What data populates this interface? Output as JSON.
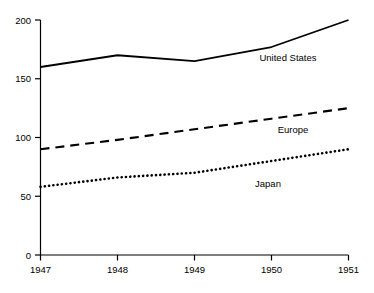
{
  "chart_data": {
    "type": "line",
    "title": "",
    "subtitle": "",
    "xlabel": "",
    "ylabel": "",
    "x": [
      1947,
      1948,
      1949,
      1950,
      1951
    ],
    "categories": [
      "1947",
      "1948",
      "1949",
      "1950",
      "1951"
    ],
    "xlim": [
      1947,
      1951
    ],
    "ylim": [
      0,
      200
    ],
    "yticks": [
      0,
      50,
      100,
      150,
      200
    ],
    "ytick_labels": [
      "0",
      "50",
      "100",
      "150",
      "200"
    ],
    "xticks": [
      1947,
      1948,
      1949,
      1950,
      1951
    ],
    "xtick_labels": [
      "1947",
      "1948",
      "1949",
      "1950",
      "1951"
    ],
    "grid": false,
    "legend_position": "inline-annotations",
    "series": [
      {
        "name": "United States",
        "style": "solid",
        "color": "#000000",
        "values": [
          160,
          170,
          165,
          177,
          200
        ],
        "label": "United States"
      },
      {
        "name": "Europe",
        "style": "dashed",
        "color": "#000000",
        "values": [
          90,
          98,
          107,
          116,
          125
        ],
        "label": "Europe"
      },
      {
        "name": "Japan",
        "style": "dotted",
        "color": "#000000",
        "values": [
          58,
          66,
          70,
          80,
          90
        ],
        "label": "Japan"
      }
    ],
    "annotations": [
      {
        "text": "United States",
        "x": 288,
        "y": 57
      },
      {
        "text": "Europe",
        "x": 293,
        "y": 129
      },
      {
        "text": "Japan",
        "x": 268,
        "y": 183
      }
    ]
  },
  "axis": {
    "y_tick_0": "0",
    "y_tick_50": "50",
    "y_tick_100": "100",
    "y_tick_150": "150",
    "y_tick_200": "200",
    "x_tick_1947": "1947",
    "x_tick_1948": "1948",
    "x_tick_1949": "1949",
    "x_tick_1950": "1950",
    "x_tick_1951": "1951"
  },
  "labels": {
    "united_states": "United States",
    "europe": "Europe",
    "japan": "Japan"
  },
  "colors": {
    "line": "#000000",
    "axis": "#000000",
    "background": "#ffffff"
  }
}
